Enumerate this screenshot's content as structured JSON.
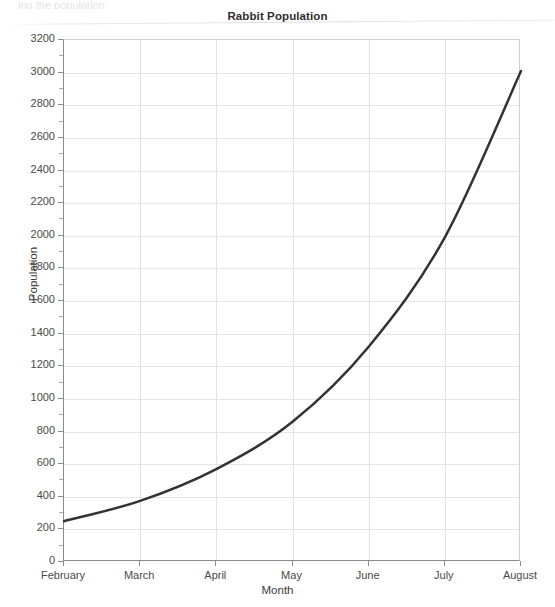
{
  "page": {
    "top_clipped_text": "ing the population",
    "background_color": "#ffffff"
  },
  "chart_data": {
    "type": "line",
    "title": "Rabbit Population",
    "xlabel": "Month",
    "ylabel": "Population",
    "categories": [
      "February",
      "March",
      "April",
      "May",
      "June",
      "July",
      "August"
    ],
    "series": [
      {
        "name": "Rabbit Population",
        "color": "#333333",
        "values": [
          250,
          375,
          570,
          860,
          1320,
          1990,
          3010
        ]
      }
    ],
    "x": [
      "February",
      "March",
      "April",
      "May",
      "June",
      "July",
      "August"
    ],
    "ylim": [
      0,
      3200
    ],
    "ytick_step": 200,
    "yticks": [
      0,
      200,
      400,
      600,
      800,
      1000,
      1200,
      1400,
      1600,
      1800,
      2000,
      2200,
      2400,
      2600,
      2800,
      3000,
      3200
    ],
    "ytick_labels": [
      "0",
      "200",
      "400",
      "600",
      "800",
      "1000",
      "1200",
      "1400",
      "1600",
      "1800",
      "2000",
      "2200",
      "2400",
      "2600",
      "2800",
      "3000",
      "3200"
    ],
    "grid": {
      "horizontal": true,
      "vertical": true,
      "horizontal_color": "#e6e6e6",
      "vertical_color": "#e2e2e2"
    },
    "legend": null,
    "legend_position": "none",
    "annotations": [],
    "axis_color": "#8c8c8c",
    "line_width": 2.5,
    "smooth": true
  }
}
